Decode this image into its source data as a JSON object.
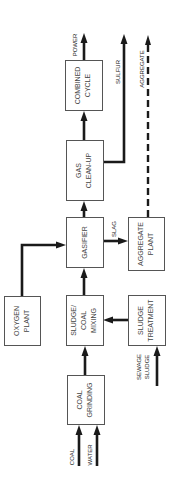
{
  "diagram": {
    "title": "",
    "boxes": {
      "combined_cycle": {
        "line1": "COMBINED",
        "line2": "CYCLE"
      },
      "gas_cleanup": {
        "line1": "GAS",
        "line2": "CLEAN-UP"
      },
      "gasifier": {
        "line1": "GASIFIER"
      },
      "aggregate_plant": {
        "line1": "AGGREGATE",
        "line2": "PLANT"
      },
      "oxygen_plant": {
        "line1": "OXYGEN",
        "line2": "PLANT"
      },
      "sludge_coal_mixing": {
        "line1": "SLUDGE/",
        "line2": "COAL",
        "line3": "MIXING"
      },
      "sludge_treatment": {
        "line1": "SLUDGE",
        "line2": "TREATMENT"
      },
      "coal_grinding": {
        "line1": "COAL",
        "line2": "GRINDING"
      }
    },
    "flow_labels": {
      "power": "POWER",
      "sulfur": "SULFUR",
      "aggregate": "AGGREGATE",
      "slag": "SLAG",
      "sewage": "SEWAGE",
      "sludge": "SLUDGE",
      "coal": "COAL",
      "water": "WATER"
    },
    "edges": [
      {
        "from": "coal",
        "to": "coal_grinding"
      },
      {
        "from": "water",
        "to": "coal_grinding"
      },
      {
        "from": "coal_grinding",
        "to": "sludge_coal_mixing"
      },
      {
        "from": "sewage_sludge",
        "to": "sludge_treatment"
      },
      {
        "from": "sludge_treatment",
        "to": "sludge_coal_mixing"
      },
      {
        "from": "sludge_coal_mixing",
        "to": "gasifier"
      },
      {
        "from": "oxygen_plant",
        "to": "gasifier"
      },
      {
        "from": "gasifier",
        "to": "gas_cleanup"
      },
      {
        "from": "gasifier",
        "to": "aggregate_plant",
        "label": "SLAG"
      },
      {
        "from": "gas_cleanup",
        "to": "combined_cycle"
      },
      {
        "from": "gas_cleanup",
        "to": "sulfur_out",
        "label": "SULFUR"
      },
      {
        "from": "combined_cycle",
        "to": "power_out",
        "label": "POWER"
      },
      {
        "from": "aggregate_plant",
        "to": "aggregate_out",
        "label": "AGGREGATE",
        "style": "dashed"
      }
    ]
  }
}
